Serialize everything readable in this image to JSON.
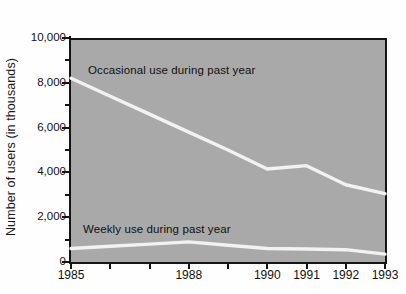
{
  "chart_data": {
    "type": "line",
    "title": "",
    "xlabel": "",
    "ylabel": "Number of users (in thousands)",
    "x": [
      1985,
      1986,
      1987,
      1988,
      1989,
      1990,
      1991,
      1992,
      1993
    ],
    "xtick_labels": [
      "1985",
      "1988",
      "1990",
      "1991",
      "1992",
      "1993"
    ],
    "xtick_values": [
      1985,
      1988,
      1990,
      1991,
      1992,
      1993
    ],
    "xlim": [
      1985,
      1993
    ],
    "ytick_labels": [
      "0",
      "2,000",
      "4,000",
      "6,000",
      "8,000",
      "10,000"
    ],
    "ytick_values": [
      0,
      2000,
      4000,
      6000,
      8000,
      10000
    ],
    "ylim": [
      0,
      10000
    ],
    "grid": false,
    "legend_position": "inline-annotations",
    "plot_background": "#a9a9a9",
    "line_color": "#f2f2f2",
    "axis_color": "#141414",
    "series": [
      {
        "name": "Occasional use during past year",
        "values": [
          8200,
          7400,
          6600,
          5800,
          5000,
          4150,
          4300,
          3450,
          3050
        ]
      },
      {
        "name": "Weekly use during past year",
        "values": [
          600,
          700,
          800,
          900,
          750,
          600,
          580,
          550,
          350
        ]
      }
    ],
    "annotations": [
      {
        "text": "Occasional use during past year",
        "series": "Occasional use during past year"
      },
      {
        "text": "Weekly use during past year",
        "series": "Weekly use during past year"
      }
    ]
  },
  "axis": {
    "y_title": "Number of users (in thousands)"
  }
}
